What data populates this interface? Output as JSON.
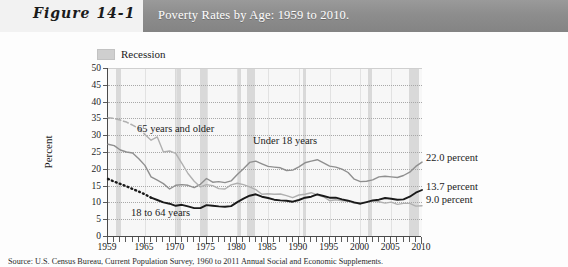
{
  "figure": {
    "label": "Figure 14-1",
    "title": "Poverty Rates by Age: 1959 to 2010."
  },
  "legend": {
    "recession_label": "Recession",
    "swatch_color": "#d9d9d9"
  },
  "caption": "Source: U.S. Census Bureau, Current Population Survey, 1960 to 2011 Annual Social and Economic Supplements.",
  "colors": {
    "header_bar": "#8d8d8d",
    "figure_label_bg": "#f2f2f2",
    "plot_bg": "#f7f7f7",
    "recession_band": "#d9d9d9",
    "series_under18": "#8f8f8f",
    "series_65plus": "#b0b0b0",
    "series_18to64": "#1a1a1a",
    "gridline": "#a8a8a8",
    "axis": "#4a4a4a"
  },
  "chart_data": {
    "type": "line",
    "title": "Poverty Rates by Age: 1959 to 2010.",
    "xlabel": "",
    "ylabel": "Percent",
    "xlim": [
      1959,
      2010
    ],
    "ylim": [
      0,
      50
    ],
    "yticks": [
      0,
      5,
      10,
      15,
      20,
      25,
      30,
      35,
      40,
      45,
      50
    ],
    "xticks": [
      1959,
      1965,
      1970,
      1975,
      1980,
      1985,
      1990,
      1995,
      2000,
      2005,
      2010
    ],
    "xtick_labels": [
      "1959",
      "1965",
      "1970",
      "1975",
      "1980",
      "1985",
      "1990",
      "1995",
      "2000",
      "2005",
      "2010"
    ],
    "grid": "horizontal-dotted",
    "legend_position": "above-plot-left",
    "x": [
      1959,
      1960,
      1961,
      1962,
      1963,
      1964,
      1965,
      1966,
      1967,
      1968,
      1969,
      1970,
      1971,
      1972,
      1973,
      1974,
      1975,
      1976,
      1977,
      1978,
      1979,
      1980,
      1981,
      1982,
      1983,
      1984,
      1985,
      1986,
      1987,
      1988,
      1989,
      1990,
      1991,
      1992,
      1993,
      1994,
      1995,
      1996,
      1997,
      1998,
      1999,
      2000,
      2001,
      2002,
      2003,
      2004,
      2005,
      2006,
      2007,
      2008,
      2009,
      2010
    ],
    "series": [
      {
        "name": "Under 18 years",
        "color": "#8f8f8f",
        "style": "solid",
        "end_label": "22.0 percent",
        "in_plot_label": "Under 18 years",
        "values": [
          27.3,
          26.9,
          25.6,
          25.0,
          24.7,
          23.0,
          21.0,
          17.6,
          16.6,
          15.6,
          14.0,
          15.1,
          15.3,
          15.1,
          14.4,
          15.4,
          17.1,
          16.0,
          16.2,
          15.9,
          16.4,
          18.3,
          20.0,
          21.9,
          22.3,
          21.5,
          20.7,
          20.5,
          20.3,
          19.5,
          19.6,
          20.6,
          21.8,
          22.3,
          22.7,
          21.8,
          20.8,
          20.5,
          19.9,
          18.9,
          16.9,
          16.2,
          16.3,
          16.7,
          17.6,
          17.8,
          17.6,
          17.4,
          18.0,
          19.0,
          20.7,
          22.0
        ]
      },
      {
        "name": "65 years and older",
        "color": "#b0b0b0",
        "style": "dashed-then-solid",
        "dashed_until": 1965,
        "end_label": "9.0 percent",
        "in_plot_label": "65 years and older",
        "values": [
          35.2,
          35.0,
          34.5,
          33.9,
          33.0,
          32.0,
          30.2,
          28.5,
          29.5,
          25.0,
          25.3,
          24.6,
          21.6,
          18.6,
          16.3,
          14.6,
          15.3,
          15.0,
          14.1,
          14.0,
          15.2,
          15.7,
          15.3,
          14.6,
          13.8,
          12.4,
          12.6,
          12.4,
          12.5,
          12.0,
          11.4,
          12.2,
          12.4,
          12.9,
          12.2,
          11.7,
          10.5,
          10.8,
          10.5,
          10.5,
          9.7,
          9.9,
          10.1,
          10.4,
          10.2,
          9.8,
          10.1,
          9.4,
          9.7,
          9.7,
          8.9,
          9.0
        ]
      },
      {
        "name": "18 to 64 years",
        "color": "#1a1a1a",
        "style": "dotted-then-solid",
        "dotted_until": 1966,
        "end_label": "13.7 percent",
        "in_plot_label": "18 to 64 years",
        "values": [
          17.0,
          16.2,
          15.5,
          14.8,
          14.0,
          13.2,
          12.4,
          11.4,
          10.7,
          10.0,
          9.6,
          9.0,
          9.3,
          8.8,
          8.3,
          8.3,
          9.2,
          9.0,
          8.8,
          8.7,
          8.9,
          10.1,
          11.1,
          12.0,
          12.4,
          11.7,
          11.3,
          10.8,
          10.6,
          10.5,
          10.2,
          10.7,
          11.4,
          11.7,
          12.4,
          11.9,
          11.4,
          11.4,
          10.9,
          10.5,
          10.0,
          9.6,
          10.1,
          10.6,
          10.8,
          11.3,
          11.1,
          10.8,
          10.9,
          11.7,
          12.9,
          13.7
        ]
      }
    ],
    "recessions": [
      {
        "start": 1960.3,
        "end": 1961.1
      },
      {
        "start": 1969.9,
        "end": 1970.9
      },
      {
        "start": 1973.9,
        "end": 1975.2
      },
      {
        "start": 1980.1,
        "end": 1980.6
      },
      {
        "start": 1981.5,
        "end": 1982.9
      },
      {
        "start": 1990.6,
        "end": 1991.2
      },
      {
        "start": 2001.2,
        "end": 2001.9
      },
      {
        "start": 2007.9,
        "end": 2009.5
      }
    ],
    "annotations": [
      {
        "text": "65 years and older",
        "x_px": 137,
        "y_px": 123
      },
      {
        "text": "Under 18 years",
        "x_px": 253,
        "y_px": 135
      },
      {
        "text": "18 to 64 years",
        "x_px": 131,
        "y_px": 207
      },
      {
        "text": "22.0 percent",
        "x_px": 426,
        "y_px": 152
      },
      {
        "text": "13.7 percent",
        "x_px": 426,
        "y_px": 181
      },
      {
        "text": "9.0 percent",
        "x_px": 426,
        "y_px": 194
      }
    ]
  }
}
